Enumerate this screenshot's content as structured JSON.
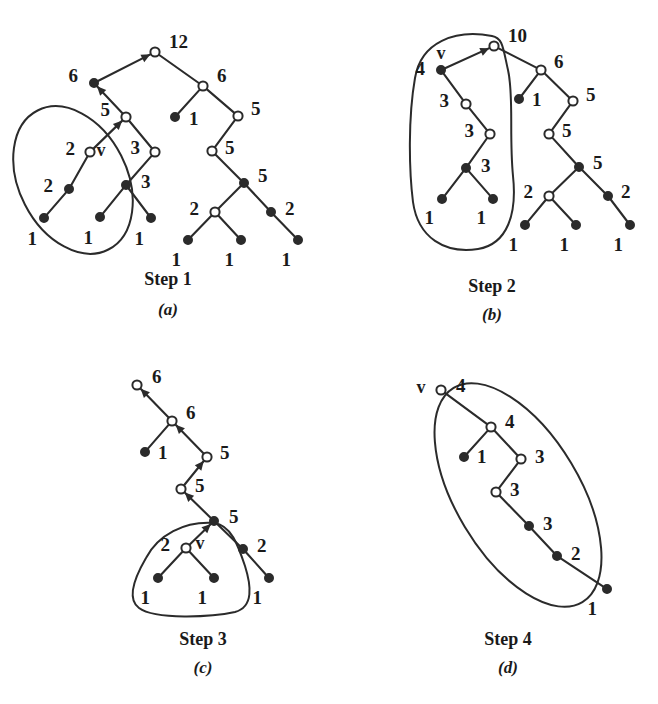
{
  "figure": {
    "background": "#ffffff",
    "ink": "#2b2b2b"
  },
  "panels": [
    {
      "id": "a",
      "caption": "Step 1",
      "subcaption": "(a)",
      "caption_x": 168,
      "caption_y": 285,
      "subcaption_x": 168,
      "subcaption_y": 315,
      "marker_label": "v",
      "marker_x": 101,
      "marker_y": 152,
      "nodes": [
        {
          "name": "a-root-12",
          "value": "12",
          "x": 155,
          "y": 52,
          "type": "open",
          "lx": 169,
          "ly": 44
        },
        {
          "name": "a-n-6-left",
          "value": "6",
          "x": 94,
          "y": 83,
          "type": "filled",
          "lx": 78,
          "ly": 78
        },
        {
          "name": "a-n-6-right",
          "value": "6",
          "x": 203,
          "y": 86,
          "type": "open",
          "lx": 217,
          "ly": 78
        },
        {
          "name": "a-n-1-mid",
          "value": "1",
          "x": 175,
          "y": 117,
          "type": "filled",
          "lx": 189,
          "ly": 121
        },
        {
          "name": "a-n-5-right",
          "value": "5",
          "x": 238,
          "y": 116,
          "type": "open",
          "lx": 251,
          "ly": 111
        },
        {
          "name": "a-n-5-left",
          "value": "5",
          "x": 126,
          "y": 117,
          "type": "open",
          "lx": 110,
          "ly": 112
        },
        {
          "name": "a-n-5-mid",
          "value": "5",
          "x": 212,
          "y": 151,
          "type": "open",
          "lx": 225,
          "ly": 150
        },
        {
          "name": "a-n-v-2",
          "value": "2",
          "x": 90,
          "y": 152,
          "type": "open",
          "lx": 75,
          "ly": 151
        },
        {
          "name": "a-n-3-right",
          "value": "3",
          "x": 155,
          "y": 152,
          "type": "open",
          "lx": 140,
          "ly": 150
        },
        {
          "name": "a-n-5-sub",
          "value": "5",
          "x": 244,
          "y": 183,
          "type": "filled",
          "lx": 258,
          "ly": 178
        },
        {
          "name": "a-n-2-left",
          "value": "2",
          "x": 69,
          "y": 189,
          "type": "filled",
          "lx": 53,
          "ly": 188
        },
        {
          "name": "a-n-3-sub",
          "value": "3",
          "x": 126,
          "y": 185,
          "type": "filled",
          "lx": 141,
          "ly": 184
        },
        {
          "name": "a-n-2-mid",
          "value": "2",
          "x": 215,
          "y": 212,
          "type": "open",
          "lx": 199,
          "ly": 211
        },
        {
          "name": "a-n-2-right",
          "value": "2",
          "x": 271,
          "y": 212,
          "type": "filled",
          "lx": 285,
          "ly": 211
        },
        {
          "name": "a-l-1-a",
          "value": "1",
          "x": 44,
          "y": 218,
          "type": "filled",
          "lx": 37,
          "ly": 241
        },
        {
          "name": "a-l-1-b",
          "value": "1",
          "x": 100,
          "y": 217,
          "type": "filled",
          "lx": 93,
          "ly": 240
        },
        {
          "name": "a-l-1-c",
          "value": "1",
          "x": 151,
          "y": 218,
          "type": "filled",
          "lx": 144,
          "ly": 241
        },
        {
          "name": "a-l-1-d",
          "value": "1",
          "x": 188,
          "y": 240,
          "type": "filled",
          "lx": 181,
          "ly": 262
        },
        {
          "name": "a-l-1-e",
          "value": "1",
          "x": 241,
          "y": 240,
          "type": "filled",
          "lx": 234,
          "ly": 262
        },
        {
          "name": "a-l-1-f",
          "value": "1",
          "x": 298,
          "y": 240,
          "type": "filled",
          "lx": 291,
          "ly": 262
        }
      ],
      "edges": [
        {
          "from": "a-n-6-left",
          "to": "a-root-12",
          "arrow": "to"
        },
        {
          "from": "a-root-12",
          "to": "a-n-6-right",
          "arrow": "none"
        },
        {
          "from": "a-n-6-right",
          "to": "a-n-1-mid",
          "arrow": "none"
        },
        {
          "from": "a-n-6-right",
          "to": "a-n-5-right",
          "arrow": "none"
        },
        {
          "from": "a-n-5-right",
          "to": "a-n-5-mid",
          "arrow": "none"
        },
        {
          "from": "a-n-5-mid",
          "to": "a-n-5-sub",
          "arrow": "none"
        },
        {
          "from": "a-n-5-sub",
          "to": "a-n-2-mid",
          "arrow": "none"
        },
        {
          "from": "a-n-5-sub",
          "to": "a-n-2-right",
          "arrow": "none"
        },
        {
          "from": "a-n-2-mid",
          "to": "a-l-1-d",
          "arrow": "none"
        },
        {
          "from": "a-n-2-mid",
          "to": "a-l-1-e",
          "arrow": "none"
        },
        {
          "from": "a-n-2-right",
          "to": "a-l-1-f",
          "arrow": "none"
        },
        {
          "from": "a-n-5-left",
          "to": "a-n-6-left",
          "arrow": "to"
        },
        {
          "from": "a-n-v-2",
          "to": "a-n-5-left",
          "arrow": "to"
        },
        {
          "from": "a-n-5-left",
          "to": "a-n-3-right",
          "arrow": "none"
        },
        {
          "from": "a-n-v-2",
          "to": "a-n-2-left",
          "arrow": "none"
        },
        {
          "from": "a-n-2-left",
          "to": "a-l-1-a",
          "arrow": "none"
        },
        {
          "from": "a-n-3-right",
          "to": "a-n-3-sub",
          "arrow": "none"
        },
        {
          "from": "a-n-3-sub",
          "to": "a-l-1-b",
          "arrow": "none"
        },
        {
          "from": "a-n-3-sub",
          "to": "a-l-1-c",
          "arrow": "none"
        }
      ],
      "enclosure": {
        "name": "selection-ellipse-a",
        "shape": "ellipse",
        "cx": 73,
        "cy": 180,
        "rx": 54,
        "ry": 78,
        "rotate": -27
      }
    },
    {
      "id": "b",
      "caption": "Step 2",
      "subcaption": "(b)",
      "caption_x": 492,
      "caption_y": 292,
      "subcaption_x": 492,
      "subcaption_y": 320,
      "marker_label": "v",
      "marker_x": 441,
      "marker_y": 55,
      "nodes": [
        {
          "name": "b-root-10",
          "value": "10",
          "x": 494,
          "y": 46,
          "type": "open",
          "lx": 508,
          "ly": 38
        },
        {
          "name": "b-n-v-4",
          "value": "4",
          "x": 441,
          "y": 70,
          "type": "filled",
          "lx": 425,
          "ly": 71
        },
        {
          "name": "b-n-6",
          "value": "6",
          "x": 541,
          "y": 70,
          "type": "open",
          "lx": 554,
          "ly": 64
        },
        {
          "name": "b-n-1-mid",
          "value": "1",
          "x": 519,
          "y": 99,
          "type": "filled",
          "lx": 532,
          "ly": 102
        },
        {
          "name": "b-n-5-up",
          "value": "5",
          "x": 573,
          "y": 101,
          "type": "open",
          "lx": 586,
          "ly": 97
        },
        {
          "name": "b-n-3-a",
          "value": "3",
          "x": 466,
          "y": 104,
          "type": "open",
          "lx": 449,
          "ly": 103
        },
        {
          "name": "b-n-3-b",
          "value": "3",
          "x": 490,
          "y": 134,
          "type": "open",
          "lx": 474,
          "ly": 133
        },
        {
          "name": "b-n-5-mid",
          "value": "5",
          "x": 549,
          "y": 134,
          "type": "open",
          "lx": 562,
          "ly": 133
        },
        {
          "name": "b-n-3-c",
          "value": "3",
          "x": 466,
          "y": 168,
          "type": "filled",
          "lx": 481,
          "ly": 168
        },
        {
          "name": "b-n-5-sub",
          "value": "5",
          "x": 579,
          "y": 167,
          "type": "filled",
          "lx": 593,
          "ly": 165
        },
        {
          "name": "b-n-2-mid",
          "value": "2",
          "x": 549,
          "y": 196,
          "type": "open",
          "lx": 533,
          "ly": 194
        },
        {
          "name": "b-n-2-right",
          "value": "2",
          "x": 608,
          "y": 196,
          "type": "filled",
          "lx": 621,
          "ly": 194
        },
        {
          "name": "b-l-1-a",
          "value": "1",
          "x": 442,
          "y": 199,
          "type": "filled",
          "lx": 434,
          "ly": 220
        },
        {
          "name": "b-l-1-b",
          "value": "1",
          "x": 493,
          "y": 199,
          "type": "filled",
          "lx": 486,
          "ly": 220
        },
        {
          "name": "b-l-1-c",
          "value": "1",
          "x": 525,
          "y": 225,
          "type": "filled",
          "lx": 518,
          "ly": 247
        },
        {
          "name": "b-l-1-d",
          "value": "1",
          "x": 576,
          "y": 225,
          "type": "filled",
          "lx": 569,
          "ly": 247
        },
        {
          "name": "b-l-1-e",
          "value": "1",
          "x": 630,
          "y": 225,
          "type": "filled",
          "lx": 623,
          "ly": 247
        }
      ],
      "edges": [
        {
          "from": "b-n-v-4",
          "to": "b-root-10",
          "arrow": "to"
        },
        {
          "from": "b-root-10",
          "to": "b-n-6",
          "arrow": "none"
        },
        {
          "from": "b-n-6",
          "to": "b-n-1-mid",
          "arrow": "none"
        },
        {
          "from": "b-n-6",
          "to": "b-n-5-up",
          "arrow": "none"
        },
        {
          "from": "b-n-5-up",
          "to": "b-n-5-mid",
          "arrow": "none"
        },
        {
          "from": "b-n-5-mid",
          "to": "b-n-5-sub",
          "arrow": "none"
        },
        {
          "from": "b-n-5-sub",
          "to": "b-n-2-mid",
          "arrow": "none"
        },
        {
          "from": "b-n-5-sub",
          "to": "b-n-2-right",
          "arrow": "none"
        },
        {
          "from": "b-n-2-mid",
          "to": "b-l-1-c",
          "arrow": "none"
        },
        {
          "from": "b-n-2-mid",
          "to": "b-l-1-d",
          "arrow": "none"
        },
        {
          "from": "b-n-2-right",
          "to": "b-l-1-e",
          "arrow": "none"
        },
        {
          "from": "b-n-v-4",
          "to": "b-n-3-a",
          "arrow": "none"
        },
        {
          "from": "b-n-3-a",
          "to": "b-n-3-b",
          "arrow": "none"
        },
        {
          "from": "b-n-3-b",
          "to": "b-n-3-c",
          "arrow": "none"
        },
        {
          "from": "b-n-3-c",
          "to": "b-l-1-a",
          "arrow": "none"
        },
        {
          "from": "b-n-3-c",
          "to": "b-l-1-b",
          "arrow": "none"
        }
      ],
      "enclosure": {
        "name": "selection-blob-b",
        "shape": "path",
        "d": "M 492 36 C 455 29 421 42 415 78 C 408 118 409 170 413 202 C 418 238 445 254 478 249 C 508 244 517 213 513 176 C 509 135 514 96 508 70 C 503 48 503 38 492 36 Z"
      }
    },
    {
      "id": "c",
      "caption": "Step 3",
      "subcaption": "(c)",
      "caption_x": 203,
      "caption_y": 645,
      "subcaption_x": 203,
      "subcaption_y": 673,
      "marker_label": "v",
      "marker_x": 200,
      "marker_y": 545,
      "nodes": [
        {
          "name": "c-root-6",
          "value": "6",
          "x": 137,
          "y": 385,
          "type": "open",
          "lx": 152,
          "ly": 379
        },
        {
          "name": "c-n-6",
          "value": "6",
          "x": 172,
          "y": 421,
          "type": "open",
          "lx": 186,
          "ly": 415
        },
        {
          "name": "c-n-1-left",
          "value": "1",
          "x": 145,
          "y": 452,
          "type": "filled",
          "lx": 158,
          "ly": 455
        },
        {
          "name": "c-n-5-up",
          "value": "5",
          "x": 207,
          "y": 457,
          "type": "open",
          "lx": 220,
          "ly": 455
        },
        {
          "name": "c-n-5-mid",
          "value": "5",
          "x": 181,
          "y": 489,
          "type": "open",
          "lx": 195,
          "ly": 488
        },
        {
          "name": "c-n-5-sub",
          "value": "5",
          "x": 214,
          "y": 521,
          "type": "filled",
          "lx": 229,
          "ly": 519
        },
        {
          "name": "c-n-v-2",
          "value": "2",
          "x": 186,
          "y": 548,
          "type": "open",
          "lx": 170,
          "ly": 547
        },
        {
          "name": "c-n-2-right",
          "value": "2",
          "x": 243,
          "y": 549,
          "type": "filled",
          "lx": 257,
          "ly": 548
        },
        {
          "name": "c-l-1-a",
          "value": "1",
          "x": 158,
          "y": 578,
          "type": "filled",
          "lx": 150,
          "ly": 600
        },
        {
          "name": "c-l-1-b",
          "value": "1",
          "x": 214,
          "y": 578,
          "type": "filled",
          "lx": 207,
          "ly": 600
        },
        {
          "name": "c-l-1-c",
          "value": "1",
          "x": 269,
          "y": 578,
          "type": "filled",
          "lx": 262,
          "ly": 600
        }
      ],
      "edges": [
        {
          "from": "c-n-6",
          "to": "c-root-6",
          "arrow": "to"
        },
        {
          "from": "c-n-6",
          "to": "c-n-1-left",
          "arrow": "none"
        },
        {
          "from": "c-n-5-up",
          "to": "c-n-6",
          "arrow": "to"
        },
        {
          "from": "c-n-5-mid",
          "to": "c-n-5-up",
          "arrow": "to"
        },
        {
          "from": "c-n-5-sub",
          "to": "c-n-5-mid",
          "arrow": "to"
        },
        {
          "from": "c-n-v-2",
          "to": "c-n-5-sub",
          "arrow": "to"
        },
        {
          "from": "c-n-5-sub",
          "to": "c-n-2-right",
          "arrow": "none"
        },
        {
          "from": "c-n-v-2",
          "to": "c-l-1-a",
          "arrow": "none"
        },
        {
          "from": "c-n-v-2",
          "to": "c-l-1-b",
          "arrow": "none"
        },
        {
          "from": "c-n-2-right",
          "to": "c-l-1-c",
          "arrow": "none"
        }
      ],
      "enclosure": {
        "name": "selection-blob-c",
        "shape": "path",
        "d": "M 214 523 C 184 521 158 535 146 558 C 132 582 128 600 139 608 C 155 620 212 617 235 612 C 254 607 251 585 245 566 C 238 545 231 525 214 523 Z"
      }
    },
    {
      "id": "d",
      "caption": "Step 4",
      "subcaption": "(d)",
      "caption_x": 508,
      "caption_y": 645,
      "subcaption_x": 508,
      "subcaption_y": 673,
      "marker_label": "v",
      "marker_x": 421,
      "marker_y": 389,
      "nodes": [
        {
          "name": "d-root-4",
          "value": "4",
          "x": 441,
          "y": 390,
          "type": "open",
          "lx": 456,
          "ly": 388
        },
        {
          "name": "d-n-4",
          "value": "4",
          "x": 491,
          "y": 427,
          "type": "open",
          "lx": 505,
          "ly": 424
        },
        {
          "name": "d-n-1",
          "value": "1",
          "x": 464,
          "y": 457,
          "type": "filled",
          "lx": 477,
          "ly": 459
        },
        {
          "name": "d-n-3-a",
          "value": "3",
          "x": 521,
          "y": 459,
          "type": "open",
          "lx": 535,
          "ly": 459
        },
        {
          "name": "d-n-3-b",
          "value": "3",
          "x": 496,
          "y": 492,
          "type": "open",
          "lx": 510,
          "ly": 492
        },
        {
          "name": "d-n-3-c",
          "value": "3",
          "x": 529,
          "y": 526,
          "type": "filled",
          "lx": 543,
          "ly": 526
        },
        {
          "name": "d-n-2",
          "value": "2",
          "x": 557,
          "y": 556,
          "type": "filled",
          "lx": 571,
          "ly": 556
        },
        {
          "name": "d-l-1",
          "value": "1",
          "x": 607,
          "y": 589,
          "type": "filled",
          "lx": 597,
          "ly": 611
        }
      ],
      "edges": [
        {
          "from": "d-root-4",
          "to": "d-n-4",
          "arrow": "none"
        },
        {
          "from": "d-n-4",
          "to": "d-n-1",
          "arrow": "none"
        },
        {
          "from": "d-n-4",
          "to": "d-n-3-a",
          "arrow": "none"
        },
        {
          "from": "d-n-3-a",
          "to": "d-n-3-b",
          "arrow": "none"
        },
        {
          "from": "d-n-3-b",
          "to": "d-n-3-c",
          "arrow": "none"
        },
        {
          "from": "d-n-3-c",
          "to": "d-n-2",
          "arrow": "none"
        },
        {
          "from": "d-n-2",
          "to": "d-l-1",
          "arrow": "none"
        }
      ],
      "enclosure": {
        "name": "selection-ellipse-d",
        "shape": "ellipse",
        "cx": 518,
        "cy": 495,
        "rx": 62,
        "ry": 125,
        "rotate": -31
      }
    }
  ]
}
